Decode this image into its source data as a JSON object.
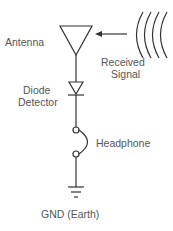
{
  "diagram": {
    "labels": {
      "antenna": "Antenna",
      "received_line1": "Received",
      "received_line2": "Signal",
      "diode_line1": "Diode",
      "diode_line2": "Detector",
      "headphone": "Headphone",
      "ground": "GND (Earth)"
    },
    "colors": {
      "line": "#333333",
      "text": "#555555"
    }
  }
}
